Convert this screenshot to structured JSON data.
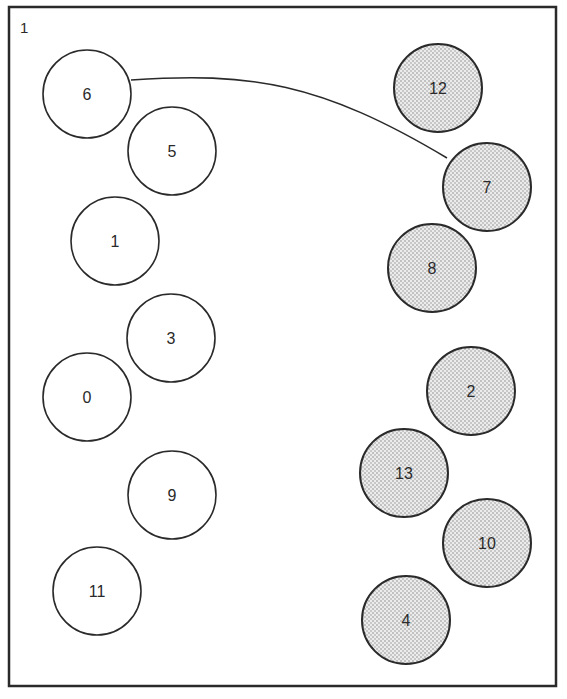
{
  "diagram": {
    "panel_label": "1",
    "colors": {
      "stroke": "#2a2a2a",
      "open_fill": "#ffffff",
      "shaded_fill": "#e2e2e2",
      "dot": "#8a8a8a"
    },
    "frame": {
      "x": 9,
      "y": 7,
      "width": 547,
      "height": 679
    },
    "radius": 44,
    "nodes": [
      {
        "id": "6",
        "label": "6",
        "x": 87,
        "y": 94,
        "style": "open"
      },
      {
        "id": "5",
        "label": "5",
        "x": 172,
        "y": 151,
        "style": "open"
      },
      {
        "id": "1",
        "label": "1",
        "x": 115,
        "y": 241,
        "style": "open"
      },
      {
        "id": "3",
        "label": "3",
        "x": 171,
        "y": 338,
        "style": "open"
      },
      {
        "id": "0",
        "label": "0",
        "x": 87,
        "y": 397,
        "style": "open"
      },
      {
        "id": "9",
        "label": "9",
        "x": 172,
        "y": 495,
        "style": "open"
      },
      {
        "id": "11",
        "label": "11",
        "x": 97,
        "y": 591,
        "style": "open"
      },
      {
        "id": "12",
        "label": "12",
        "x": 438,
        "y": 88,
        "style": "shaded"
      },
      {
        "id": "7",
        "label": "7",
        "x": 487,
        "y": 187,
        "style": "shaded"
      },
      {
        "id": "8",
        "label": "8",
        "x": 432,
        "y": 268,
        "style": "shaded"
      },
      {
        "id": "2",
        "label": "2",
        "x": 471,
        "y": 391,
        "style": "shaded"
      },
      {
        "id": "13",
        "label": "13",
        "x": 404,
        "y": 473,
        "style": "shaded"
      },
      {
        "id": "10",
        "label": "10",
        "x": 487,
        "y": 543,
        "style": "shaded"
      },
      {
        "id": "4",
        "label": "4",
        "x": 406,
        "y": 620,
        "style": "shaded"
      }
    ],
    "edges": [
      {
        "from": "6",
        "to": "7",
        "path": "M131,80 C250,72 320,82 447,158"
      }
    ]
  }
}
